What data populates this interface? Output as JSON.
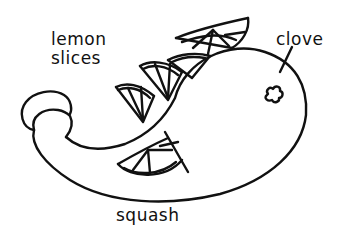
{
  "diagram": {
    "stroke_color": "#111111",
    "background_color": "#ffffff",
    "labels": {
      "lemon": [
        "lemon",
        "slices"
      ],
      "clove": "clove",
      "squash": "squash"
    },
    "parts": [
      {
        "name": "squash-body",
        "label": "squash"
      },
      {
        "name": "lemon-slice",
        "count": 4,
        "label": "lemon slices"
      },
      {
        "name": "clove",
        "label": "clove"
      }
    ]
  }
}
